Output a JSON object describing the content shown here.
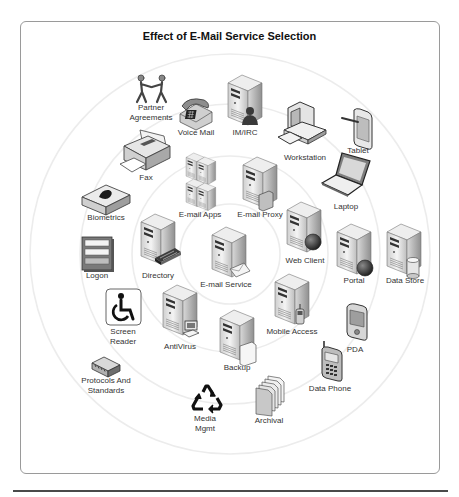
{
  "diagram": {
    "title": "Effect of E-Mail Service Selection",
    "center": "E-mail Service",
    "rings": [
      {
        "ring": 0,
        "radius": 50,
        "nodes": [
          "E-mail Service"
        ]
      },
      {
        "ring": 1,
        "radius": 98,
        "nodes": [
          "E-mail Apps",
          "E-mail Proxy",
          "Web Client",
          "Mobile Access",
          "Backup",
          "AntiVirus",
          "Directory"
        ]
      },
      {
        "ring": 2,
        "radius": 150,
        "nodes": [
          "Voice Mail",
          "IM/IRC",
          "Workstation",
          "Laptop",
          "Portal",
          "PDA",
          "Data Phone",
          "Archival",
          "Media Mgmt",
          "Screen Reader",
          "Logon",
          "Biometrics",
          "Fax"
        ]
      },
      {
        "ring": 3,
        "radius": 198,
        "nodes": [
          "Partner Agreements",
          "Tablet",
          "Data Store",
          "Protocols And Standards"
        ]
      }
    ]
  },
  "nodes": {
    "partner": {
      "line1": "Partner",
      "line2": "Agreements",
      "icon": "people-handshake-icon"
    },
    "voicemail": {
      "label": "Voice Mail",
      "icon": "telephone-icon"
    },
    "imirc": {
      "label": "IM/IRC",
      "icon": "server-user-icon"
    },
    "workstation": {
      "label": "Workstation",
      "icon": "desktop-computer-icon"
    },
    "tablet": {
      "label": "Tablet",
      "icon": "tablet-icon"
    },
    "fax": {
      "label": "Fax",
      "icon": "fax-machine-icon"
    },
    "laptop": {
      "label": "Laptop",
      "icon": "laptop-icon"
    },
    "biometrics": {
      "label": "Biometrics",
      "icon": "fingerprint-pad-icon"
    },
    "emailapps": {
      "label": "E-mail Apps",
      "icon": "server-cluster-icon"
    },
    "emailproxy": {
      "label": "E-mail Proxy",
      "icon": "server-proxy-icon"
    },
    "webclient": {
      "label": "Web Client",
      "icon": "server-globe-icon"
    },
    "logon": {
      "label": "Logon",
      "icon": "login-form-icon"
    },
    "directory": {
      "label": "Directory",
      "icon": "server-directory-icon"
    },
    "emailservice": {
      "label": "E-mail Service",
      "icon": "server-mail-icon"
    },
    "portal": {
      "label": "Portal",
      "icon": "server-globe-icon"
    },
    "datastore": {
      "label": "Data Store",
      "icon": "server-database-icon"
    },
    "screenreader": {
      "line1": "Screen",
      "line2": "Reader",
      "icon": "accessibility-icon"
    },
    "antivirus": {
      "label": "AntiVirus",
      "icon": "server-computer-icon"
    },
    "mobileaccess": {
      "label": "Mobile Access",
      "icon": "server-phone-icon"
    },
    "backup": {
      "label": "Backup",
      "icon": "server-document-icon"
    },
    "pda": {
      "label": "PDA",
      "icon": "pda-icon"
    },
    "protocols": {
      "line1": "Protocols And",
      "line2": "Standards",
      "icon": "hardware-module-icon"
    },
    "dataphone": {
      "label": "Data Phone",
      "icon": "mobile-phone-icon"
    },
    "mediamgmt": {
      "line1": "Media",
      "line2": "Mgmt",
      "icon": "recycle-icon"
    },
    "archival": {
      "label": "Archival",
      "icon": "document-stack-icon"
    }
  },
  "colors": {
    "ring": "#ececec",
    "frame": "#9a9a9a",
    "rule": "#4a4a4a",
    "server_light": "#f2f2f2",
    "server_dark": "#9c9c9c"
  }
}
